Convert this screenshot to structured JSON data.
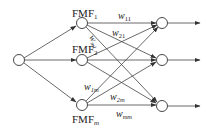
{
  "diagram": {
    "type": "fuzzy neural network",
    "nodes": {
      "input": {
        "label": ""
      },
      "fmf": [
        {
          "name": "FMF",
          "sub": "1"
        },
        {
          "name": "FMF",
          "sub": "2"
        },
        {
          "name": "FMF",
          "sub": "m"
        }
      ],
      "outputs": [
        {
          "label": ""
        },
        {
          "label": ""
        },
        {
          "label": ""
        }
      ]
    },
    "weights": [
      {
        "w": "w",
        "sub": "11"
      },
      {
        "w": "w",
        "sub": "21"
      },
      {
        "w": "w",
        "sub": "m1"
      },
      {
        "w": "w",
        "sub": "1m"
      },
      {
        "w": "w",
        "sub": "2m"
      },
      {
        "w": "w",
        "sub": "mm"
      }
    ],
    "colors": {
      "stroke": "#333333",
      "background": "#ffffff"
    }
  }
}
